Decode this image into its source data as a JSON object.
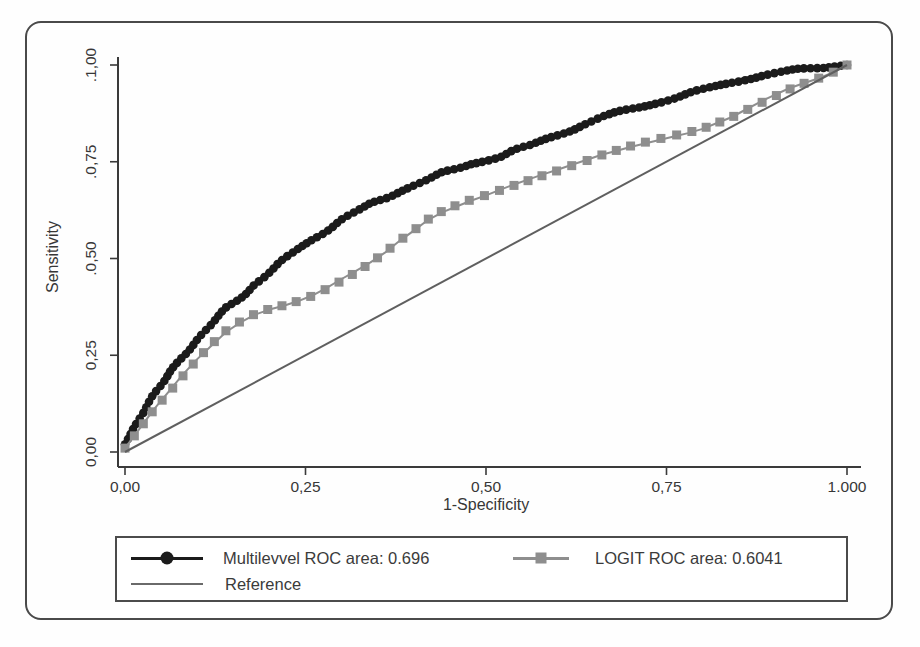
{
  "figure": {
    "background": "#fefefe",
    "frame_color": "#4a4a4a",
    "axis_color": "#3a3a3a",
    "text_color": "#373737"
  },
  "chart_data": {
    "type": "line",
    "title": "",
    "xlabel": "1-Specificity",
    "ylabel": "Sensitivity",
    "xlim": [
      0,
      1
    ],
    "ylim": [
      0,
      1
    ],
    "grid": false,
    "legend_position": "bottom",
    "x_ticks": [
      {
        "v": 0.0,
        "label": "0,00"
      },
      {
        "v": 0.25,
        "label": "0,25"
      },
      {
        "v": 0.5,
        "label": "0,50"
      },
      {
        "v": 0.75,
        "label": "0,75"
      },
      {
        "v": 1.0,
        "label": "1.000"
      }
    ],
    "y_ticks": [
      {
        "v": 0.0,
        "label": "0,00"
      },
      {
        "v": 0.25,
        "label": "0,25"
      },
      {
        "v": 0.5,
        "label": ".0,50"
      },
      {
        "v": 0.75,
        "label": ".0,75"
      },
      {
        "v": 1.0,
        "label": ".1,00"
      }
    ],
    "series": [
      {
        "id": "multilevel",
        "name": "Multilevvel ROC area: 0.696",
        "auc": 0.696,
        "marker": "circle",
        "color": "#1b1b1b",
        "points": [
          [
            0,
            0.02
          ],
          [
            0.01,
            0.055
          ],
          [
            0.02,
            0.09
          ],
          [
            0.03,
            0.12
          ],
          [
            0.04,
            0.145
          ],
          [
            0.05,
            0.17
          ],
          [
            0.06,
            0.2
          ],
          [
            0.07,
            0.225
          ],
          [
            0.08,
            0.25
          ],
          [
            0.09,
            0.27
          ],
          [
            0.1,
            0.29
          ],
          [
            0.11,
            0.31
          ],
          [
            0.12,
            0.33
          ],
          [
            0.13,
            0.35
          ],
          [
            0.14,
            0.37
          ],
          [
            0.15,
            0.385
          ],
          [
            0.16,
            0.4
          ],
          [
            0.17,
            0.415
          ],
          [
            0.18,
            0.435
          ],
          [
            0.19,
            0.45
          ],
          [
            0.2,
            0.465
          ],
          [
            0.22,
            0.495
          ],
          [
            0.24,
            0.525
          ],
          [
            0.26,
            0.55
          ],
          [
            0.28,
            0.575
          ],
          [
            0.3,
            0.6
          ],
          [
            0.32,
            0.62
          ],
          [
            0.34,
            0.64
          ],
          [
            0.36,
            0.655
          ],
          [
            0.38,
            0.675
          ],
          [
            0.4,
            0.69
          ],
          [
            0.42,
            0.705
          ],
          [
            0.44,
            0.72
          ],
          [
            0.46,
            0.73
          ],
          [
            0.48,
            0.745
          ],
          [
            0.5,
            0.755
          ],
          [
            0.52,
            0.765
          ],
          [
            0.54,
            0.78
          ],
          [
            0.56,
            0.79
          ],
          [
            0.58,
            0.805
          ],
          [
            0.6,
            0.82
          ],
          [
            0.62,
            0.835
          ],
          [
            0.64,
            0.85
          ],
          [
            0.66,
            0.865
          ],
          [
            0.68,
            0.875
          ],
          [
            0.7,
            0.885
          ],
          [
            0.72,
            0.895
          ],
          [
            0.74,
            0.905
          ],
          [
            0.76,
            0.915
          ],
          [
            0.78,
            0.925
          ],
          [
            0.8,
            0.935
          ],
          [
            0.82,
            0.945
          ],
          [
            0.84,
            0.955
          ],
          [
            0.86,
            0.965
          ],
          [
            0.88,
            0.972
          ],
          [
            0.9,
            0.978
          ],
          [
            0.92,
            0.984
          ],
          [
            0.94,
            0.989
          ],
          [
            0.96,
            0.993
          ],
          [
            0.98,
            0.997
          ],
          [
            1,
            1
          ]
        ]
      },
      {
        "id": "logit",
        "name": "LOGIT ROC area: 0.6041",
        "auc": 0.6041,
        "marker": "square",
        "color": "#8e8e8e",
        "points": [
          [
            0,
            0.01
          ],
          [
            0.02,
            0.06
          ],
          [
            0.04,
            0.11
          ],
          [
            0.06,
            0.155
          ],
          [
            0.08,
            0.2
          ],
          [
            0.1,
            0.24
          ],
          [
            0.12,
            0.275
          ],
          [
            0.14,
            0.31
          ],
          [
            0.16,
            0.335
          ],
          [
            0.18,
            0.355
          ],
          [
            0.2,
            0.368
          ],
          [
            0.22,
            0.378
          ],
          [
            0.24,
            0.39
          ],
          [
            0.26,
            0.405
          ],
          [
            0.28,
            0.425
          ],
          [
            0.3,
            0.447
          ],
          [
            0.32,
            0.468
          ],
          [
            0.34,
            0.49
          ],
          [
            0.36,
            0.515
          ],
          [
            0.38,
            0.545
          ],
          [
            0.4,
            0.572
          ],
          [
            0.42,
            0.6
          ],
          [
            0.44,
            0.62
          ],
          [
            0.46,
            0.635
          ],
          [
            0.48,
            0.65
          ],
          [
            0.5,
            0.663
          ],
          [
            0.52,
            0.678
          ],
          [
            0.54,
            0.692
          ],
          [
            0.56,
            0.705
          ],
          [
            0.58,
            0.718
          ],
          [
            0.6,
            0.73
          ],
          [
            0.62,
            0.743
          ],
          [
            0.64,
            0.755
          ],
          [
            0.66,
            0.768
          ],
          [
            0.68,
            0.778
          ],
          [
            0.7,
            0.788
          ],
          [
            0.72,
            0.797
          ],
          [
            0.74,
            0.806
          ],
          [
            0.76,
            0.815
          ],
          [
            0.78,
            0.824
          ],
          [
            0.8,
            0.835
          ],
          [
            0.82,
            0.85
          ],
          [
            0.84,
            0.865
          ],
          [
            0.86,
            0.885
          ],
          [
            0.88,
            0.905
          ],
          [
            0.9,
            0.923
          ],
          [
            0.92,
            0.94
          ],
          [
            0.94,
            0.953
          ],
          [
            0.96,
            0.965
          ],
          [
            0.98,
            0.98
          ],
          [
            1,
            1
          ]
        ]
      },
      {
        "id": "reference",
        "name": "Reference",
        "marker": "none",
        "color": "#5f5f5f",
        "points": [
          [
            0,
            0
          ],
          [
            1,
            1
          ]
        ]
      }
    ]
  },
  "legend": {
    "items": [
      {
        "label": "Multilevvel ROC area: 0.696",
        "marker": "circle",
        "color": "#1b1b1b"
      },
      {
        "label": "LOGIT ROC area: 0.6041",
        "marker": "square",
        "color": "#8e8e8e"
      },
      {
        "label": "Reference",
        "marker": "line",
        "color": "#6a6a6a"
      }
    ]
  }
}
